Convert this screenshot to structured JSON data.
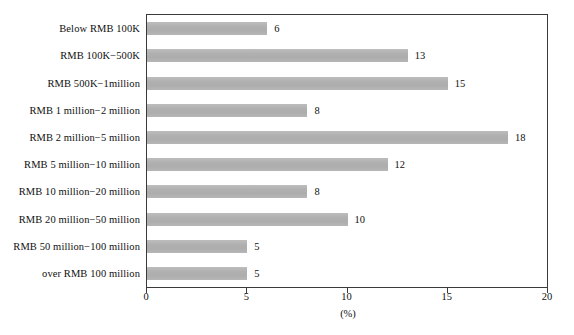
{
  "chart_data": {
    "type": "bar",
    "orientation": "horizontal",
    "title": "",
    "subtitle": "",
    "xlabel": "(%)",
    "ylabel": "",
    "xlim": [
      0,
      20
    ],
    "xticks": [
      0,
      5,
      10,
      15,
      20
    ],
    "xtick_labels": [
      "0",
      "5",
      "10",
      "15",
      "20"
    ],
    "grid": false,
    "legend": null,
    "bar_color": "#b2b2b2",
    "frame_color": "#3a3a3a",
    "background": "#ffffff",
    "categories": [
      "Below RMB 100K",
      "RMB 100K−500K",
      "RMB 500K−1million",
      "RMB 1 million−2 million",
      "RMB 2 million−5 million",
      "RMB 5 million−10 million",
      "RMB 10 million−20 million",
      "RMB 20 million−50 million",
      "RMB 50 million−100 million",
      "over RMB 100 million"
    ],
    "values": [
      6,
      13,
      15,
      8,
      18,
      12,
      8,
      10,
      5,
      5
    ],
    "value_labels": [
      "6",
      "13",
      "15",
      "8",
      "18",
      "12",
      "8",
      "10",
      "5",
      "5"
    ]
  }
}
